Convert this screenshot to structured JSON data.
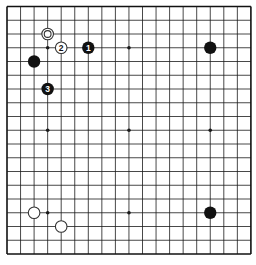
{
  "board": {
    "size": 19,
    "origin_x": 7,
    "origin_y": 6.5,
    "spacing_x": 13.55,
    "spacing_y": 13.75,
    "line_color": "#1a1a1a",
    "border_color": "#111111",
    "background": "#ffffff",
    "star_points": [
      {
        "col": 3,
        "row": 3
      },
      {
        "col": 9,
        "row": 3
      },
      {
        "col": 15,
        "row": 3
      },
      {
        "col": 3,
        "row": 9
      },
      {
        "col": 9,
        "row": 9
      },
      {
        "col": 15,
        "row": 9
      },
      {
        "col": 3,
        "row": 15
      },
      {
        "col": 9,
        "row": 15
      },
      {
        "col": 15,
        "row": 15
      }
    ]
  },
  "stones": [
    {
      "id": "white-marked",
      "color": "white",
      "col": 3,
      "row": 2,
      "label": "",
      "marked": true
    },
    {
      "id": "white-2",
      "color": "white",
      "col": 4,
      "row": 3,
      "label": "2",
      "marked": false
    },
    {
      "id": "black-1",
      "color": "black",
      "col": 6,
      "row": 3,
      "label": "1",
      "marked": false
    },
    {
      "id": "black-upper-left",
      "color": "black",
      "col": 2,
      "row": 4,
      "label": "",
      "marked": false
    },
    {
      "id": "black-3",
      "color": "black",
      "col": 3,
      "row": 6,
      "label": "3",
      "marked": false
    },
    {
      "id": "black-upper-right",
      "color": "black",
      "col": 15,
      "row": 3,
      "label": "",
      "marked": false
    },
    {
      "id": "white-lower-left-a",
      "color": "white",
      "col": 2,
      "row": 15,
      "label": "",
      "marked": false
    },
    {
      "id": "white-lower-left-b",
      "color": "white",
      "col": 4,
      "row": 16,
      "label": "",
      "marked": false
    },
    {
      "id": "black-lower-right",
      "color": "black",
      "col": 15,
      "row": 15,
      "label": "",
      "marked": false
    }
  ],
  "colors": {
    "black_stone": "#111111",
    "white_stone_fill": "#ffffff",
    "white_stone_stroke": "#333333",
    "black_label": "#ffffff",
    "white_label": "#111111"
  }
}
